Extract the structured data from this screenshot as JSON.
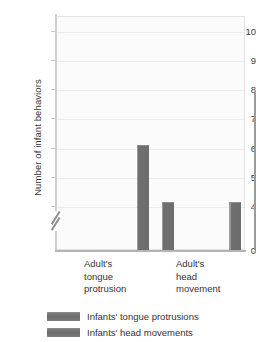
{
  "chart_data": {
    "type": "bar",
    "title": "",
    "xlabel": "",
    "ylabel": "Number of infant behaviors",
    "categories": [
      "Adult's tongue protrusion",
      "Adult's head movement"
    ],
    "category_lines": [
      [
        "Adult's",
        "tongue",
        "protrusion"
      ],
      [
        "Adult's",
        "head",
        "movement"
      ]
    ],
    "series": [
      {
        "name": "Infants' tongue protrusions",
        "values": [
          6.1,
          4.15
        ]
      },
      {
        "name": "Infants' head movements",
        "values": [
          4.15,
          7.85
        ]
      }
    ],
    "ylim": [
      0,
      10.5
    ],
    "y_ticks": [
      0,
      4,
      5,
      6,
      7,
      8,
      9,
      10
    ],
    "y_tick_labels": [
      "0",
      "4",
      "5",
      "6",
      "7",
      "8",
      "9",
      "10"
    ],
    "axis_break": true,
    "axis_break_between": [
      0,
      4
    ],
    "grid": true,
    "grid_axis": "y",
    "legend_position": "bottom-left",
    "bar_color": "#6d6d6d",
    "plot_background": "#fbfbfb",
    "gridline_color": "#ececec"
  },
  "legend": {
    "items": [
      {
        "label": "Infants' tongue protrusions",
        "color": "#6d6d6d"
      },
      {
        "label": "Infants' head movements",
        "color": "#6d6d6d"
      }
    ]
  }
}
